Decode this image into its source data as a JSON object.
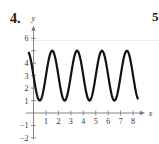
{
  "problem_number": "4.",
  "next_problem_number": "5",
  "chart_data": {
    "type": "line",
    "title": "",
    "xlabel": "x",
    "ylabel": "y",
    "xlim": [
      -0.4,
      8.6
    ],
    "ylim": [
      -2,
      6.5
    ],
    "x_ticks": [
      1,
      2,
      3,
      4,
      5,
      6,
      7,
      8
    ],
    "x_tick_labels": [
      "1",
      "2",
      "3",
      "4",
      "5",
      "6",
      "7",
      "8"
    ],
    "y_ticks": [
      -2,
      -1,
      1,
      2,
      3,
      4,
      5,
      6
    ],
    "y_tick_labels": [
      "−2",
      "−1",
      "1",
      "2",
      "3",
      "4",
      "",
      "6"
    ],
    "grid": false,
    "series": [
      {
        "name": "curve",
        "description": "sinusoid oscillating between y=1 and y=5, period 2",
        "function": "y = 3 + 2cos(π(x − 1.5))",
        "x_start": -0.4,
        "x_end": 8.4,
        "maxima_x": [
          1.5,
          3.5,
          5.5,
          7.5
        ],
        "minima_x": [
          0.5,
          2.5,
          4.5,
          6.5
        ],
        "max_y": 5,
        "min_y": 1,
        "color": "#111111"
      }
    ]
  },
  "layout": {
    "origin_px": [
      33.5,
      113
    ],
    "unit_px": 12.45
  }
}
